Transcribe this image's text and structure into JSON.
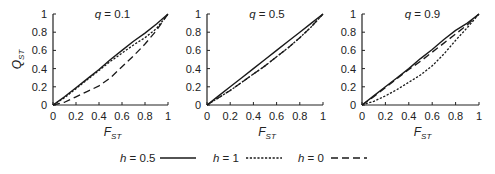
{
  "chart_data": [
    {
      "type": "line",
      "title_var": "q",
      "title": "q = 0.1",
      "title_value": "= 0.1",
      "xlabel": "F",
      "xlabel_sub": "ST",
      "ylabel": "Q",
      "ylabel_sub": "ST",
      "xlim": [
        0,
        1
      ],
      "ylim": [
        0,
        1
      ],
      "xticks": [
        "0",
        "0.2",
        "0.4",
        "0.6",
        "0.8",
        "1"
      ],
      "yticks": [
        "0",
        "0.2",
        "0.4",
        "0.6",
        "0.8",
        "1"
      ],
      "x": [
        0,
        0.1,
        0.2,
        0.3,
        0.4,
        0.5,
        0.6,
        0.7,
        0.8,
        0.9,
        1.0
      ],
      "series": [
        {
          "name": "h = 0.5",
          "style": "solid",
          "values": [
            0,
            0.09,
            0.19,
            0.29,
            0.39,
            0.5,
            0.6,
            0.7,
            0.79,
            0.89,
            1.0
          ]
        },
        {
          "name": "h = 1",
          "style": "dotted",
          "values": [
            0,
            0.08,
            0.18,
            0.28,
            0.38,
            0.48,
            0.57,
            0.66,
            0.74,
            0.84,
            1.0
          ]
        },
        {
          "name": "h = 0",
          "style": "dashed",
          "values": [
            0,
            0.03,
            0.09,
            0.15,
            0.21,
            0.3,
            0.42,
            0.54,
            0.67,
            0.82,
            1.0
          ]
        }
      ],
      "show_y_labels": true
    },
    {
      "type": "line",
      "title_var": "q",
      "title": "q = 0.5",
      "title_value": "= 0.5",
      "xlabel": "F",
      "xlabel_sub": "ST",
      "ylabel": "",
      "ylabel_sub": "",
      "xlim": [
        0,
        1
      ],
      "ylim": [
        0,
        1
      ],
      "xticks": [
        "0",
        "0.2",
        "0.4",
        "0.6",
        "0.8",
        "1"
      ],
      "yticks": [
        "0",
        "0.2",
        "0.4",
        "0.6",
        "0.8",
        "1"
      ],
      "x": [
        0,
        0.1,
        0.2,
        0.3,
        0.4,
        0.5,
        0.6,
        0.7,
        0.8,
        0.9,
        1.0
      ],
      "series": [
        {
          "name": "h = 0.5",
          "style": "solid",
          "values": [
            0,
            0.1,
            0.2,
            0.3,
            0.4,
            0.5,
            0.6,
            0.7,
            0.8,
            0.9,
            1.0
          ]
        },
        {
          "name": "h = 1",
          "style": "dotted",
          "values": [
            0,
            0.08,
            0.16,
            0.25,
            0.34,
            0.43,
            0.53,
            0.63,
            0.74,
            0.86,
            1.0
          ]
        },
        {
          "name": "h = 0",
          "style": "dashed",
          "values": [
            0,
            0.08,
            0.16,
            0.25,
            0.34,
            0.43,
            0.53,
            0.63,
            0.74,
            0.86,
            1.0
          ]
        }
      ],
      "show_y_labels": true
    },
    {
      "type": "line",
      "title_var": "q",
      "title": "q = 0.9",
      "title_value": "= 0.9",
      "xlabel": "F",
      "xlabel_sub": "ST",
      "ylabel": "",
      "ylabel_sub": "",
      "xlim": [
        0,
        1
      ],
      "ylim": [
        0,
        1
      ],
      "xticks": [
        "0",
        "0.2",
        "0.4",
        "0.6",
        "0.8",
        "1"
      ],
      "yticks": [
        "0",
        "0.2",
        "0.4",
        "0.6",
        "0.8",
        "1"
      ],
      "x": [
        0,
        0.1,
        0.2,
        0.3,
        0.4,
        0.5,
        0.6,
        0.7,
        0.8,
        0.9,
        1.0
      ],
      "series": [
        {
          "name": "h = 0.5",
          "style": "solid",
          "values": [
            0,
            0.1,
            0.2,
            0.3,
            0.4,
            0.51,
            0.61,
            0.72,
            0.82,
            0.9,
            1.0
          ]
        },
        {
          "name": "h = 1",
          "style": "dotted",
          "values": [
            0,
            0.04,
            0.1,
            0.17,
            0.25,
            0.33,
            0.43,
            0.56,
            0.71,
            0.85,
            1.0
          ]
        },
        {
          "name": "h = 0",
          "style": "dashed",
          "values": [
            0,
            0.09,
            0.19,
            0.29,
            0.39,
            0.48,
            0.58,
            0.68,
            0.78,
            0.88,
            1.0
          ]
        }
      ],
      "show_y_labels": true
    }
  ],
  "legend": {
    "position": "bottom-center",
    "items": [
      {
        "label": "h = 0.5",
        "var": "h",
        "value": "= 0.5",
        "style": "solid"
      },
      {
        "label": "h = 1",
        "var": "h",
        "value": "= 1",
        "style": "dotted"
      },
      {
        "label": "h = 0",
        "var": "h",
        "value": "= 0",
        "style": "dashed"
      }
    ]
  }
}
